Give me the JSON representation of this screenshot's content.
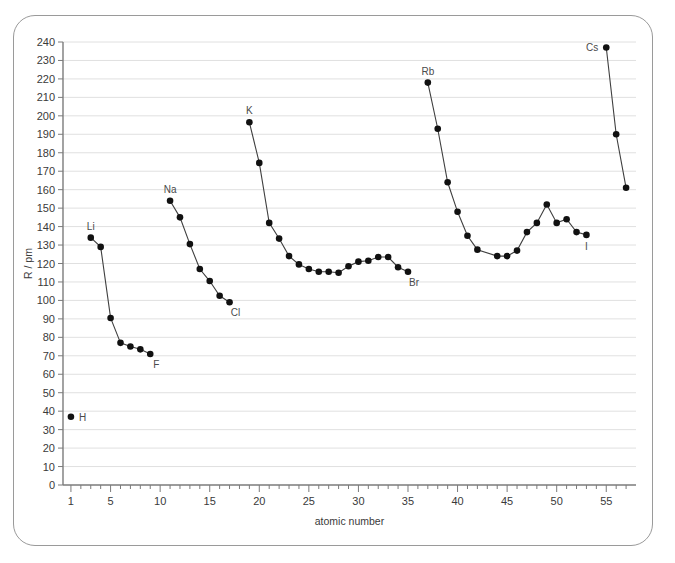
{
  "figure": {
    "border_color": "#9a9a9a",
    "background": "#ffffff"
  },
  "chart_data": {
    "type": "line",
    "title": "",
    "xlabel": "atomic number",
    "ylabel": "R / pm",
    "xlim": [
      0.2,
      58
    ],
    "ylim": [
      0,
      240
    ],
    "grid": true,
    "legend": null,
    "line_color": "#3f3f3f",
    "marker_color": "#111111",
    "x_ticks_major": [
      1,
      5,
      10,
      15,
      20,
      25,
      30,
      35,
      40,
      45,
      50,
      55
    ],
    "x_tick_step_minor": 1,
    "y_ticks": [
      0,
      10,
      20,
      30,
      40,
      50,
      60,
      70,
      80,
      90,
      100,
      110,
      120,
      130,
      140,
      150,
      160,
      170,
      180,
      190,
      200,
      210,
      220,
      230,
      240
    ],
    "series": [
      {
        "name": "hydrogen",
        "points": [
          {
            "x": 1,
            "y": 37,
            "label": "H",
            "label_pos": "right"
          }
        ]
      },
      {
        "name": "period-2",
        "points": [
          {
            "x": 3,
            "y": 134,
            "label": "Li",
            "label_pos": "above"
          },
          {
            "x": 4,
            "y": 129,
            "label": "",
            "label_pos": ""
          },
          {
            "x": 5,
            "y": 90.5,
            "label": "",
            "label_pos": ""
          },
          {
            "x": 6,
            "y": 77,
            "label": "",
            "label_pos": ""
          },
          {
            "x": 7,
            "y": 75,
            "label": "",
            "label_pos": ""
          },
          {
            "x": 8,
            "y": 73.5,
            "label": "",
            "label_pos": ""
          },
          {
            "x": 9,
            "y": 71,
            "label": "F",
            "label_pos": "below-right"
          }
        ]
      },
      {
        "name": "period-3",
        "points": [
          {
            "x": 11,
            "y": 154,
            "label": "Na",
            "label_pos": "above"
          },
          {
            "x": 12,
            "y": 145,
            "label": "",
            "label_pos": ""
          },
          {
            "x": 13,
            "y": 130.5,
            "label": "",
            "label_pos": ""
          },
          {
            "x": 14,
            "y": 117,
            "label": "",
            "label_pos": ""
          },
          {
            "x": 15,
            "y": 110.5,
            "label": "",
            "label_pos": ""
          },
          {
            "x": 16,
            "y": 102.5,
            "label": "",
            "label_pos": ""
          },
          {
            "x": 17,
            "y": 99,
            "label": "Cl",
            "label_pos": "below-right"
          }
        ]
      },
      {
        "name": "period-4",
        "points": [
          {
            "x": 19,
            "y": 196.5,
            "label": "K",
            "label_pos": "above"
          },
          {
            "x": 20,
            "y": 174.5,
            "label": "",
            "label_pos": ""
          },
          {
            "x": 21,
            "y": 142,
            "label": "",
            "label_pos": ""
          },
          {
            "x": 22,
            "y": 133.5,
            "label": "",
            "label_pos": ""
          },
          {
            "x": 23,
            "y": 124,
            "label": "",
            "label_pos": ""
          },
          {
            "x": 24,
            "y": 119.5,
            "label": "",
            "label_pos": ""
          },
          {
            "x": 25,
            "y": 117,
            "label": "",
            "label_pos": ""
          },
          {
            "x": 26,
            "y": 115.5,
            "label": "",
            "label_pos": ""
          },
          {
            "x": 27,
            "y": 115.5,
            "label": "",
            "label_pos": ""
          },
          {
            "x": 28,
            "y": 115,
            "label": "",
            "label_pos": ""
          },
          {
            "x": 29,
            "y": 118.5,
            "label": "",
            "label_pos": ""
          },
          {
            "x": 30,
            "y": 121,
            "label": "",
            "label_pos": ""
          },
          {
            "x": 31,
            "y": 121.5,
            "label": "",
            "label_pos": ""
          },
          {
            "x": 32,
            "y": 123.5,
            "label": "",
            "label_pos": ""
          },
          {
            "x": 33,
            "y": 123.5,
            "label": "",
            "label_pos": ""
          },
          {
            "x": 34,
            "y": 118,
            "label": "",
            "label_pos": ""
          },
          {
            "x": 35,
            "y": 115.5,
            "label": "Br",
            "label_pos": "below-right"
          }
        ]
      },
      {
        "name": "period-5",
        "points": [
          {
            "x": 37,
            "y": 218,
            "label": "Rb",
            "label_pos": "above"
          },
          {
            "x": 38,
            "y": 193,
            "label": "",
            "label_pos": ""
          },
          {
            "x": 39,
            "y": 164,
            "label": "",
            "label_pos": ""
          },
          {
            "x": 40,
            "y": 148,
            "label": "",
            "label_pos": ""
          },
          {
            "x": 41,
            "y": 135,
            "label": "",
            "label_pos": ""
          },
          {
            "x": 42,
            "y": 127.5,
            "label": "",
            "label_pos": ""
          },
          {
            "x": 44,
            "y": 124,
            "label": "",
            "label_pos": ""
          },
          {
            "x": 45,
            "y": 124,
            "label": "",
            "label_pos": ""
          },
          {
            "x": 46,
            "y": 127,
            "label": "",
            "label_pos": ""
          },
          {
            "x": 47,
            "y": 137,
            "label": "",
            "label_pos": ""
          },
          {
            "x": 48,
            "y": 142,
            "label": "",
            "label_pos": ""
          },
          {
            "x": 49,
            "y": 152,
            "label": "",
            "label_pos": ""
          },
          {
            "x": 50,
            "y": 142,
            "label": "",
            "label_pos": ""
          },
          {
            "x": 51,
            "y": 144,
            "label": "",
            "label_pos": ""
          },
          {
            "x": 52,
            "y": 137,
            "label": "",
            "label_pos": ""
          },
          {
            "x": 53,
            "y": 135.5,
            "label": "I",
            "label_pos": "below"
          }
        ]
      },
      {
        "name": "period-6",
        "points": [
          {
            "x": 55,
            "y": 237,
            "label": "Cs",
            "label_pos": "left"
          },
          {
            "x": 56,
            "y": 190,
            "label": "",
            "label_pos": ""
          },
          {
            "x": 57,
            "y": 161,
            "label": "",
            "label_pos": ""
          }
        ]
      }
    ]
  }
}
